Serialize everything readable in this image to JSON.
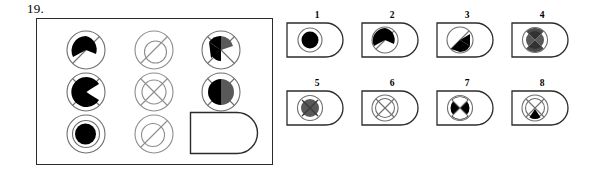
{
  "item": {
    "number": "19.",
    "type": "matrix-reasoning-multiple-choice"
  },
  "matrix": {
    "rows": 3,
    "columns": 3,
    "cells": [
      {
        "id": "r1c1",
        "row": 1,
        "col": 1,
        "overlay": "slash",
        "inner": "pie-wedge-black-top-left",
        "fill": "black",
        "description": "circle with diagonal slash and black quarter wedge"
      },
      {
        "id": "r1c2",
        "row": 1,
        "col": 2,
        "overlay": "slash",
        "inner": "circle-outline",
        "fill": "none",
        "description": "circle with diagonal slash and empty inner circle"
      },
      {
        "id": "r1c3",
        "row": 1,
        "col": 3,
        "overlay": "cross-x",
        "inner": "two-wedges",
        "fill": "black-and-gray",
        "description": "circle with X, black wedge left and gray wedge upper-right"
      },
      {
        "id": "r2c1",
        "row": 2,
        "col": 1,
        "overlay": "slash",
        "inner": "pacman-black",
        "fill": "black",
        "description": "circle with diagonal slash and black pac-man shape"
      },
      {
        "id": "r2c2",
        "row": 2,
        "col": 2,
        "overlay": "cross-x",
        "inner": "circle-outline",
        "fill": "none",
        "description": "circle with X and empty inner circle"
      },
      {
        "id": "r2c3",
        "row": 2,
        "col": 3,
        "overlay": "cross-x",
        "inner": "two-wedges-horizontal",
        "fill": "black-and-gray",
        "description": "circle with X, black wedge left and gray wedge right"
      },
      {
        "id": "r3c1",
        "row": 3,
        "col": 1,
        "overlay": "ring",
        "inner": "disc-black",
        "fill": "black",
        "description": "circle with inner ring and solid black disc"
      },
      {
        "id": "r3c2",
        "row": 3,
        "col": 2,
        "overlay": "slash",
        "inner": "circle-outline",
        "fill": "none",
        "description": "circle with diagonal slash and empty inner circle"
      },
      {
        "id": "r3c3",
        "row": 3,
        "col": 3,
        "overlay": "none",
        "inner": "answer-slot",
        "fill": "none",
        "description": "empty answer slot, D-shaped box"
      }
    ]
  },
  "options": [
    {
      "label": "1",
      "name": "option-1",
      "overlay": "ring",
      "inner": "disc-black",
      "fill": "black",
      "description": "ring with solid black disc"
    },
    {
      "label": "2",
      "name": "option-2",
      "overlay": "slash",
      "inner": "pie-wedge-black",
      "fill": "black",
      "description": "circle with slash and black wedge"
    },
    {
      "label": "3",
      "name": "option-3",
      "overlay": "slash",
      "inner": "pie-wedge-black-lower",
      "fill": "black",
      "description": "circle with slash and black lower wedge"
    },
    {
      "label": "4",
      "name": "option-4",
      "overlay": "cross-x",
      "inner": "disc-dark-gray",
      "fill": "gray",
      "description": "circle with X and dark gray disc"
    },
    {
      "label": "5",
      "name": "option-5",
      "overlay": "cross-x",
      "inner": "disc-gray",
      "fill": "gray",
      "description": "ring with X over gray disc"
    },
    {
      "label": "6",
      "name": "option-6",
      "overlay": "cross-x",
      "inner": "circle-outline",
      "fill": "none",
      "description": "circle with X, unfilled"
    },
    {
      "label": "7",
      "name": "option-7",
      "overlay": "cross-x",
      "inner": "disc-black",
      "fill": "black",
      "description": "ring with X over solid black disc"
    },
    {
      "label": "8",
      "name": "option-8",
      "overlay": "cross-x",
      "inner": "triangle-black",
      "fill": "black",
      "description": "circle with X and small black triangle"
    }
  ],
  "colors": {
    "stroke": "#2b2b2b",
    "stroke_light": "#7a7a7a",
    "fill_black": "#000000",
    "fill_gray": "#595959",
    "background": "#ffffff"
  }
}
